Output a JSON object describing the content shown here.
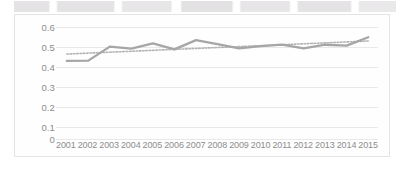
{
  "chart_data": {
    "type": "line",
    "title": "",
    "xlabel": "",
    "ylabel": "",
    "ylim": [
      0,
      0.6
    ],
    "yticks": [
      "0.6",
      "0.5",
      "0.4",
      "0.3",
      "0.2",
      "0.1",
      "0"
    ],
    "ytick_values": [
      0.6,
      0.5,
      0.4,
      0.3,
      0.2,
      0.1,
      0
    ],
    "grid": true,
    "legend": "none",
    "categories": [
      "2001",
      "2002",
      "2003",
      "2004",
      "2005",
      "2006",
      "2007",
      "2008",
      "2009",
      "2010",
      "2011",
      "2012",
      "2013",
      "2014",
      "2015"
    ],
    "series": [
      {
        "name": "data-series",
        "style": "solid",
        "color": "#a6a6a6",
        "values": [
          0.418,
          0.42,
          0.495,
          0.484,
          0.512,
          0.48,
          0.53,
          0.508,
          0.485,
          0.498,
          0.506,
          0.485,
          0.505,
          0.5,
          0.545
        ]
      },
      {
        "name": "trendline",
        "style": "dotted",
        "color": "#b3b3b3",
        "values": [
          0.455,
          0.46,
          0.465,
          0.47,
          0.475,
          0.48,
          0.485,
          0.49,
          0.495,
          0.5,
          0.505,
          0.51,
          0.515,
          0.52,
          0.525
        ]
      }
    ]
  },
  "colors": {
    "series": "#a6a6a6",
    "trend": "#b3b3b3",
    "grid": "#e9e9e9",
    "axis_text": "#8d8d8d",
    "border": "#e4e4e4",
    "background": "#ffffff"
  }
}
